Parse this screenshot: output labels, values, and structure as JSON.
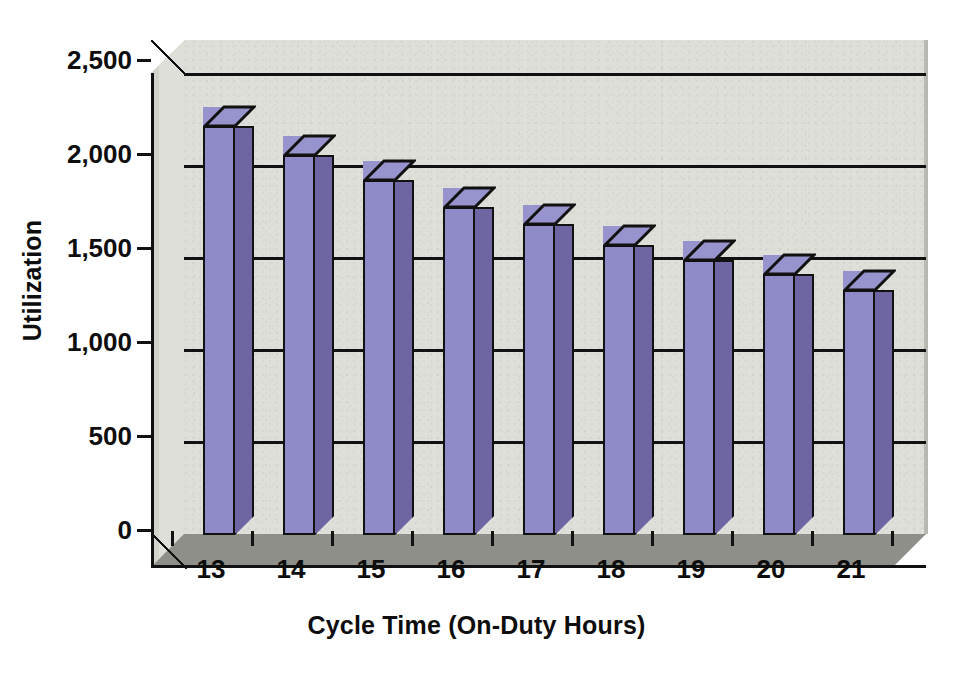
{
  "chart_data": {
    "type": "bar",
    "title": "",
    "xlabel": "Cycle Time (On-Duty Hours)",
    "ylabel": "Utilization",
    "categories": [
      "13",
      "14",
      "15",
      "16",
      "17",
      "18",
      "19",
      "20",
      "21"
    ],
    "values": [
      2220,
      2060,
      1925,
      1780,
      1685,
      1570,
      1490,
      1415,
      1330
    ],
    "ylim": [
      0,
      2500
    ],
    "ytick_labels": [
      "0",
      "500",
      "1,000",
      "1,500",
      "2,000",
      "2,500"
    ],
    "ytick_values": [
      0,
      500,
      1000,
      1500,
      2000,
      2500
    ],
    "grid": true,
    "legend": false,
    "style": "3d-column",
    "colors": {
      "bar_front": "#8e8bc8",
      "bar_side": "#6d66a2",
      "bar_top": "#9793cd",
      "plot_background": "#dedfd9",
      "side_wall": "#d2d3cd",
      "floor": "#8f8f8a",
      "axis": "#111111",
      "text": "#0d0d0d",
      "page_background": "#ffffff"
    }
  }
}
